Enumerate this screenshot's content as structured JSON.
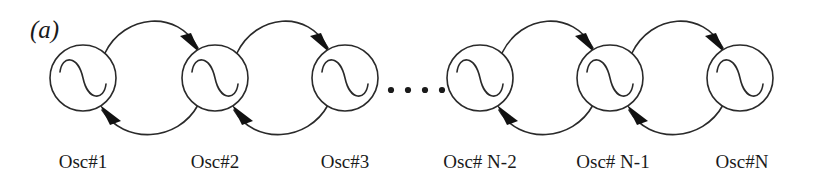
{
  "figure": {
    "panel_label": "(a)",
    "caption_note": "",
    "background_color": "#ffffff",
    "line_color": "#2a2a2a",
    "arrow_color": "#111111",
    "text_color": "#1a1a1a"
  },
  "diagram": {
    "type": "coupled-oscillator-chain",
    "oscillator_count_drawn": 6,
    "ellipsis_dot_count": 4,
    "coupling": "bidirectional-nearest-neighbor",
    "oscillators": [
      {
        "id": "osc1",
        "label": "Osc#1",
        "cx": 83,
        "cy": 78,
        "r": 33,
        "icon": "sine-wave-icon"
      },
      {
        "id": "osc2",
        "label": "Osc#2",
        "cx": 215,
        "cy": 78,
        "r": 33,
        "icon": "sine-wave-icon"
      },
      {
        "id": "osc3",
        "label": "Osc#3",
        "cx": 345,
        "cy": 78,
        "r": 33,
        "icon": "sine-wave-icon"
      },
      {
        "id": "oscN-2",
        "label": "Osc# N-2",
        "cx": 480,
        "cy": 78,
        "r": 33,
        "icon": "sine-wave-icon"
      },
      {
        "id": "oscN-1",
        "label": "Osc# N-1",
        "cx": 610,
        "cy": 78,
        "r": 33,
        "icon": "sine-wave-icon"
      },
      {
        "id": "oscN",
        "label": "Osc#N",
        "cx": 740,
        "cy": 78,
        "r": 33,
        "icon": "sine-wave-icon"
      }
    ],
    "forward_arcs": [
      {
        "from": "osc1",
        "to": "osc2",
        "direction": "right"
      },
      {
        "from": "osc2",
        "to": "osc3",
        "direction": "right"
      },
      {
        "from": "oscN-2",
        "to": "oscN-1",
        "direction": "right"
      },
      {
        "from": "oscN-1",
        "to": "oscN",
        "direction": "right"
      }
    ],
    "backward_arcs": [
      {
        "from": "osc2",
        "to": "osc1",
        "direction": "left"
      },
      {
        "from": "osc3",
        "to": "osc2",
        "direction": "left"
      },
      {
        "from": "oscN-1",
        "to": "oscN-2",
        "direction": "left"
      },
      {
        "from": "oscN",
        "to": "oscN-1",
        "direction": "left"
      }
    ],
    "ellipsis": {
      "dots": 4,
      "x_start": 391,
      "x_step": 17,
      "y": 90,
      "radius": 3.1
    }
  }
}
